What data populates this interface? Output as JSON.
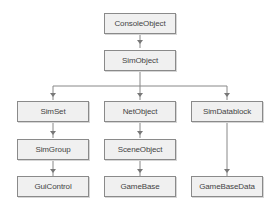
{
  "diagram": {
    "type": "class-hierarchy",
    "colors": {
      "background": "#ffffff",
      "node_fill": "#f0f0f0",
      "node_border": "#8a8a8a",
      "text": "#444444",
      "edge": "#888888"
    },
    "nodes": {
      "console_object": {
        "label": "ConsoleObject"
      },
      "sim_object": {
        "label": "SimObject"
      },
      "sim_set": {
        "label": "SimSet"
      },
      "net_object": {
        "label": "NetObject"
      },
      "sim_datablock": {
        "label": "SimDatablock"
      },
      "sim_group": {
        "label": "SimGroup"
      },
      "scene_object": {
        "label": "SceneObject"
      },
      "gui_control": {
        "label": "GuiControl"
      },
      "game_base": {
        "label": "GameBase"
      },
      "game_base_data": {
        "label": "GameBaseData"
      }
    },
    "edges": [
      {
        "from": "ConsoleObject",
        "to": "SimObject"
      },
      {
        "from": "SimObject",
        "to": "SimSet"
      },
      {
        "from": "SimObject",
        "to": "NetObject"
      },
      {
        "from": "SimObject",
        "to": "SimDatablock"
      },
      {
        "from": "SimSet",
        "to": "SimGroup"
      },
      {
        "from": "SimGroup",
        "to": "GuiControl"
      },
      {
        "from": "NetObject",
        "to": "SceneObject"
      },
      {
        "from": "SceneObject",
        "to": "GameBase"
      },
      {
        "from": "SimDatablock",
        "to": "GameBaseData"
      }
    ]
  }
}
